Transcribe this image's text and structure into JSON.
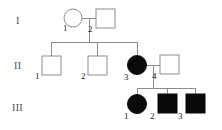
{
  "figure": {
    "type": "pedigree-chart",
    "width": 222,
    "height": 130,
    "background_color": "#ffffff",
    "line_color": "#8d8d8d",
    "affected_fill_color": "#0a0a0a",
    "unaffected_fill_color": "#ffffff",
    "label_color": "#1a1a1a"
  },
  "generations": [
    {
      "label": "I",
      "x": 16,
      "y": 24
    },
    {
      "label": "II",
      "x": 14,
      "y": 69
    },
    {
      "label": "III",
      "x": 12,
      "y": 111
    }
  ],
  "individuals": [
    {
      "id": "I-1",
      "generation": "I",
      "number": "1",
      "sex": "female",
      "shape": "circle",
      "affected": false,
      "cx": 73,
      "cy": 18,
      "r": 9,
      "label_x": 63,
      "label_y": 31
    },
    {
      "id": "I-2",
      "generation": "I",
      "number": "2",
      "sex": "male",
      "shape": "square",
      "affected": false,
      "x": 96,
      "y": 9,
      "size": 19,
      "label_x": 88,
      "label_y": 32
    },
    {
      "id": "II-1",
      "generation": "II",
      "number": "1",
      "sex": "male",
      "shape": "square",
      "affected": false,
      "x": 42,
      "y": 56,
      "size": 19,
      "label_x": 35,
      "label_y": 79
    },
    {
      "id": "II-2",
      "generation": "II",
      "number": "2",
      "sex": "male",
      "shape": "square",
      "affected": false,
      "x": 88,
      "y": 56,
      "size": 19,
      "label_x": 81,
      "label_y": 79
    },
    {
      "id": "II-3",
      "generation": "II",
      "number": "3",
      "sex": "female",
      "shape": "circle",
      "affected": true,
      "cx": 137,
      "cy": 65,
      "r": 9.5,
      "label_x": 124,
      "label_y": 80
    },
    {
      "id": "II-4",
      "generation": "II",
      "number": "4",
      "sex": "male",
      "shape": "square",
      "affected": false,
      "x": 160,
      "y": 55,
      "size": 19,
      "label_x": 152,
      "label_y": 79
    },
    {
      "id": "III-1",
      "generation": "III",
      "number": "1",
      "sex": "female",
      "shape": "circle",
      "affected": true,
      "cx": 137,
      "cy": 104,
      "r": 9.5,
      "label_x": 124,
      "label_y": 119
    },
    {
      "id": "III-2",
      "generation": "III",
      "number": "2",
      "sex": "male",
      "shape": "square",
      "affected": true,
      "x": 158,
      "y": 94,
      "size": 19,
      "label_x": 150,
      "label_y": 119
    },
    {
      "id": "III-3",
      "generation": "III",
      "number": "3",
      "sex": "male",
      "shape": "square",
      "affected": true,
      "x": 186,
      "y": 94,
      "size": 19,
      "label_x": 178,
      "label_y": 119
    }
  ],
  "connections": {
    "mating_line_gen1": {
      "x1": 82,
      "y1": 18,
      "x2": 96,
      "y2": 18
    },
    "descent_line_gen1": {
      "x1": 89,
      "y1": 18,
      "x2": 89,
      "y2": 42
    },
    "sibship_bar_gen2": {
      "x1": 51,
      "y1": 42,
      "x2": 137,
      "y2": 42
    },
    "drops_gen2": [
      {
        "x": 51,
        "y1": 42,
        "y2": 56
      },
      {
        "x": 97,
        "y1": 42,
        "y2": 56
      },
      {
        "x": 137,
        "y1": 42,
        "y2": 56
      }
    ],
    "mating_line_gen2": {
      "x1": 146,
      "y1": 65,
      "x2": 160,
      "y2": 65
    },
    "descent_line_gen2": {
      "x1": 153,
      "y1": 65,
      "x2": 153,
      "y2": 88
    },
    "sibship_bar_gen3": {
      "x1": 137,
      "y1": 88,
      "x2": 195,
      "y2": 88
    },
    "drops_gen3": [
      {
        "x": 137,
        "y1": 88,
        "y2": 95
      },
      {
        "x": 167,
        "y1": 88,
        "y2": 94
      },
      {
        "x": 195,
        "y1": 88,
        "y2": 94
      }
    ]
  }
}
